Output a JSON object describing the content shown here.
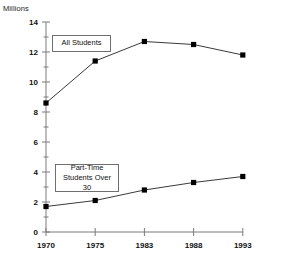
{
  "chart_data": {
    "type": "line",
    "title": "",
    "subtitle": "",
    "xlabel": "",
    "ylabel": "Millions",
    "categories": [
      "1970",
      "1975",
      "1983",
      "1988",
      "1993"
    ],
    "x_tick_labels": [
      "1970",
      "1975",
      "1983",
      "1988",
      "1993"
    ],
    "y_tick_labels": [
      "0",
      "2",
      "4",
      "6",
      "8",
      "10",
      "12",
      "14"
    ],
    "y_tick_values": [
      0,
      2,
      4,
      6,
      8,
      10,
      12,
      14
    ],
    "ylim": [
      0,
      14
    ],
    "minor_ticks": true,
    "grid": false,
    "legend_position": "inline-callout",
    "marker": "square",
    "marker_color": "#000000",
    "line_color": "#3a3a3a",
    "axis_color": "#7a7a7a",
    "series": [
      {
        "name": "All Students",
        "values": [
          8.6,
          11.4,
          12.7,
          12.5,
          11.8
        ]
      },
      {
        "name": "Part-Time Students Over 30",
        "values": [
          1.7,
          2.1,
          2.8,
          3.3,
          3.7
        ]
      }
    ],
    "annotations": [
      {
        "id": "all-students",
        "text": "All Students"
      },
      {
        "id": "part-time",
        "text": "Part-Time\nStudents Over 30"
      }
    ]
  },
  "axis": {
    "unit_label": "Millions"
  }
}
